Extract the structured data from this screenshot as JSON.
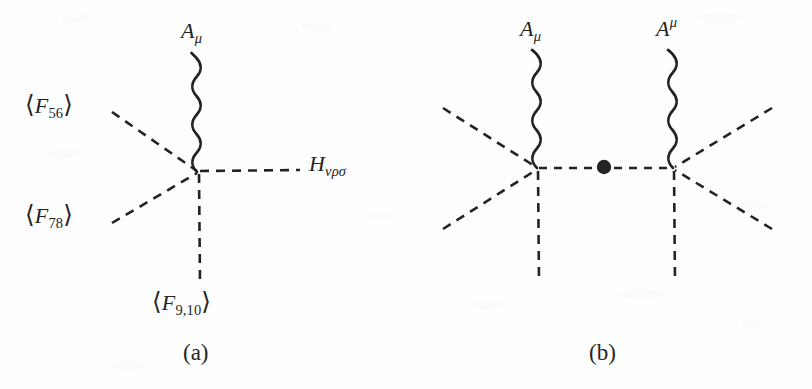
{
  "figure": {
    "type": "feynman-diagram-pair",
    "background_color": "#fefefe",
    "ink_color": "#232323",
    "panels": [
      {
        "id": "a",
        "caption": "(a)",
        "description": "Single vertex with one wavy photon line, three dashed flux lines and one dashed H line",
        "labels": {
          "photon_top": {
            "base": "A",
            "sub": "μ",
            "text": "Aμ"
          },
          "flux_upper_left": {
            "open": "⟨",
            "base": "F",
            "sub": "56",
            "close": "⟩",
            "text": "⟨F56⟩"
          },
          "flux_lower_left": {
            "open": "⟨",
            "base": "F",
            "sub": "78",
            "close": "⟩",
            "text": "⟨F78⟩"
          },
          "flux_bottom": {
            "open": "⟨",
            "base": "F",
            "sub": "9,10",
            "close": "⟩",
            "text": "⟨F9,10⟩"
          },
          "h_field_right": {
            "base": "H",
            "sub": "νρσ",
            "text": "Hνρσ"
          }
        }
      },
      {
        "id": "b",
        "caption": "(b)",
        "description": "Two vertices joined by a dashed propagator with a filled blob in the middle; each vertex has a wavy photon line and three dashed flux lines",
        "labels": {
          "photon_left": {
            "base": "A",
            "sub": "μ",
            "text": "Aμ"
          },
          "photon_right": {
            "base": "A",
            "sup": "μ",
            "text": "Aμ"
          }
        }
      }
    ]
  },
  "geometry": {
    "panel_a": {
      "vertex": {
        "x": 198,
        "y": 172
      },
      "photon_top_end": {
        "y": 56
      },
      "dashed_endpoints": {
        "upper_left": {
          "x": 112,
          "y": 112
        },
        "lower_left": {
          "x": 112,
          "y": 222
        },
        "bottom": {
          "x": 200,
          "y": 283
        },
        "right": {
          "x": 300,
          "y": 170
        }
      }
    },
    "panel_b": {
      "vertex_left": {
        "x": 537,
        "y": 168
      },
      "vertex_right": {
        "x": 673,
        "y": 168
      },
      "blob": {
        "x": 604,
        "y": 167,
        "r": 7
      },
      "photon_top_end": {
        "y": 56
      },
      "dashed_endpoints": {
        "left_upper": {
          "x": 443,
          "y": 108
        },
        "left_lower": {
          "x": 443,
          "y": 228
        },
        "left_bottom": {
          "x": 539,
          "y": 283
        },
        "right_upper": {
          "x": 772,
          "y": 108
        },
        "right_lower": {
          "x": 772,
          "y": 228
        },
        "right_bottom": {
          "x": 675,
          "y": 283
        }
      }
    }
  }
}
